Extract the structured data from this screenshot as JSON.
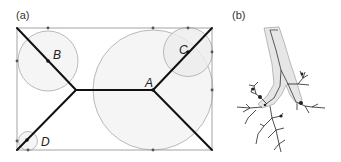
{
  "panels": {
    "a": {
      "label": "(a)",
      "points": [
        {
          "name": "A",
          "x": 153,
          "y": 90
        },
        {
          "name": "B",
          "x": 48,
          "y": 61
        },
        {
          "name": "C",
          "x": 188,
          "y": 52
        },
        {
          "name": "D",
          "x": 26,
          "y": 141
        }
      ]
    },
    "b": {
      "label": "(b)"
    }
  },
  "colors": {
    "frame": "#9a9a9a",
    "skeleton": "#111111",
    "circle_stroke": "#a8a8a8",
    "circle_fill": "#f3f3f3"
  }
}
